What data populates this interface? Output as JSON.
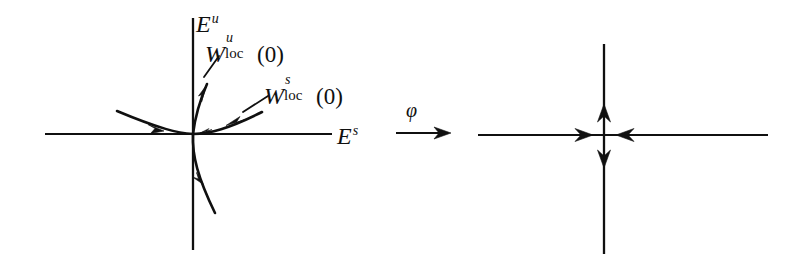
{
  "figure": {
    "background_color": "#ffffff",
    "ink_color": "#101010",
    "width": 806,
    "height": 260
  },
  "left_panel": {
    "name": "nonlinear-phase-portrait",
    "axes": {
      "vertical": {
        "label_base": "E",
        "label_superscript": "u",
        "meaning": "unstable-subspace-axis"
      },
      "horizontal": {
        "label_base": "E",
        "label_superscript": "s",
        "meaning": "stable-subspace-axis"
      }
    },
    "manifolds": [
      {
        "name": "local-unstable-manifold",
        "base": "W",
        "superscript": "u",
        "subscript": "loc",
        "argument": "(0)",
        "flow_direction": "outward"
      },
      {
        "name": "local-stable-manifold",
        "base": "W",
        "superscript": "s",
        "subscript": "loc",
        "argument": "(0)",
        "flow_direction": "inward"
      }
    ],
    "fixed_point": "0"
  },
  "map_arrow": {
    "name": "conjugacy-map",
    "label": "φ"
  },
  "right_panel": {
    "name": "linearized-phase-portrait",
    "axes": {
      "vertical": {
        "meaning": "unstable-subspace-axis",
        "flow_direction": "outward"
      },
      "horizontal": {
        "meaning": "stable-subspace-axis",
        "flow_direction": "inward"
      }
    }
  }
}
